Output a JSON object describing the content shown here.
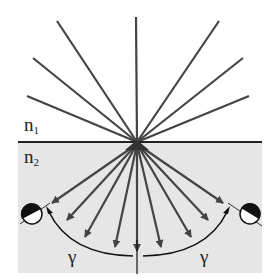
{
  "diagram": {
    "labels": {
      "medium_upper": "n",
      "medium_upper_sub": "1",
      "medium_lower": "n",
      "medium_lower_sub": "2",
      "angle_left": "γ",
      "angle_right": "γ"
    },
    "upper_rays_count": 7,
    "lower_arrows_count": 9,
    "detectors": [
      "left-detector",
      "right-detector"
    ],
    "colors": {
      "ray": "#444444",
      "interface": "#222222",
      "lower_medium": "#e6e6e6",
      "detector_dark": "#111111",
      "detector_light": "#ffffff"
    }
  }
}
